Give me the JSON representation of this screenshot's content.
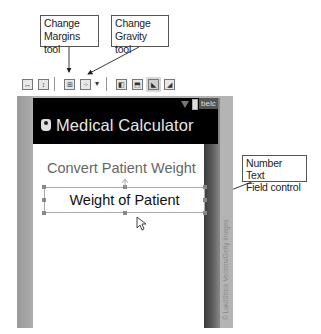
{
  "callouts": {
    "margins": {
      "line1": "Change",
      "line2": "Margins tool"
    },
    "gravity": {
      "line1": "Change",
      "line2": "Gravity tool"
    },
    "number_field": {
      "line1": "Number Text",
      "line2": "Field control"
    }
  },
  "toolbar": {
    "icons": [
      {
        "name": "fill-width-icon",
        "glyph": "↔"
      },
      {
        "name": "fill-height-icon",
        "glyph": "↕"
      },
      {
        "name": "change-margins-icon",
        "glyph": "⊞"
      },
      {
        "name": "change-gravity-icon",
        "glyph": "⁘"
      },
      {
        "name": "dropdown-arrow-icon",
        "glyph": "▾"
      },
      {
        "name": "align-left-icon",
        "glyph": "◧"
      },
      {
        "name": "align-top-icon",
        "glyph": "⬒"
      },
      {
        "name": "align-bottom-left-icon",
        "glyph": "◣"
      },
      {
        "name": "align-bottom-right-icon",
        "glyph": "◢"
      }
    ]
  },
  "device": {
    "status_text": "belc",
    "app_title": "Medical Calculator",
    "heading": "Convert Patient Weight",
    "number_field_text": "Weight of Patient"
  },
  "credit": "© Luk/iStock Vectors/Getty Images",
  "colors": {
    "action_bar": "#000000",
    "heading_text": "#666666",
    "field_text": "#111111",
    "frame_gray": "#b4b4b4"
  }
}
